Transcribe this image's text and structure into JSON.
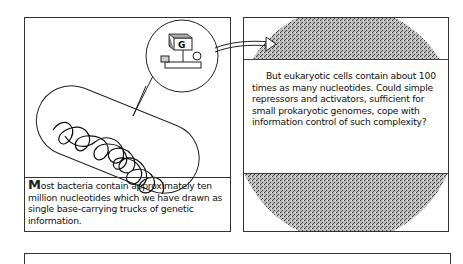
{
  "left_panel": {
    "dropcap": "M",
    "caption_rest": "ost bacteria contain approximately ten million nucleotides which we have drawn as single base-carrying trucks of genetic information.",
    "truck_label": "G"
  },
  "right_panel": {
    "caption": "But eukaryotic cells contain about 100 times as many nucleotides. Could simple repressors and activators, sufficient for small prokaryotic genomes, cope with information control of such complexity?"
  },
  "colors": {
    "ink": "#111111",
    "stipple": "#8a8a8a",
    "paper": "#ffffff"
  }
}
